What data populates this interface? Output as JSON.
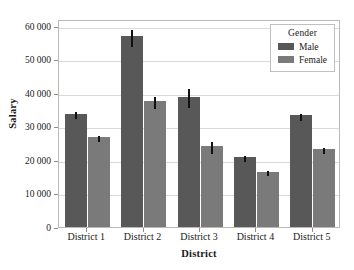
{
  "chart_data": {
    "type": "bar",
    "title": "",
    "xlabel": "District",
    "ylabel": "Salary",
    "categories": [
      "District 1",
      "District 2",
      "District 3",
      "District 4",
      "District 5"
    ],
    "ylim": [
      0,
      62000
    ],
    "yticks": [
      0,
      10000,
      20000,
      30000,
      40000,
      50000,
      60000
    ],
    "ytick_labels": [
      "0",
      "10 000",
      "20 000",
      "30 000",
      "40 000",
      "50 000",
      "60 000"
    ],
    "grid": true,
    "legend": {
      "title": "Gender",
      "position": "top-right",
      "entries": [
        {
          "label": "Male",
          "color": "#585858"
        },
        {
          "label": "Female",
          "color": "#7a7a7a"
        }
      ]
    },
    "error_bars": "visible",
    "series": [
      {
        "name": "Male",
        "color": "#585858",
        "values": [
          33800,
          56800,
          38900,
          20800,
          33300
        ],
        "errors": [
          1100,
          2600,
          2700,
          900,
          1000
        ]
      },
      {
        "name": "Female",
        "color": "#7a7a7a",
        "values": [
          26800,
          37500,
          24100,
          16500,
          23300
        ],
        "errors": [
          800,
          1800,
          1800,
          800,
          800
        ]
      }
    ]
  }
}
